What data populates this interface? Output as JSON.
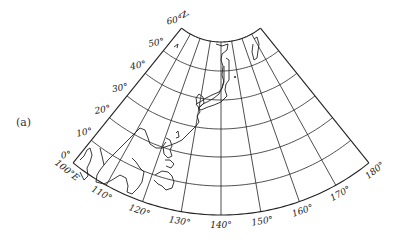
{
  "figure": {
    "panel_label": "(a)",
    "projection": "conic",
    "north_label": "N",
    "east_label_suffix": "E",
    "line_color": "#222222",
    "background": "#ffffff"
  },
  "graticule": {
    "apex": [
      221,
      -21
    ],
    "lon_center": 140,
    "deg_per_lon": 0.97,
    "lat_radius": {
      "0": 236,
      "10": 207,
      "20": 178,
      "30": 150,
      "40": 121,
      "50": 92,
      "60": 63
    },
    "latitudes": [
      0,
      10,
      20,
      30,
      40,
      50,
      60
    ],
    "longitudes": [
      100,
      110,
      120,
      130,
      140,
      150,
      160,
      170,
      180
    ],
    "lat_labels": [
      "0°",
      "10°",
      "20°",
      "30°",
      "40°",
      "50°",
      "60°"
    ],
    "lon_labels": [
      "100°E",
      "110°",
      "120°",
      "130°",
      "140°",
      "150°",
      "160°",
      "170°",
      "180°"
    ]
  },
  "coastlines": [
    {
      "name": "sakhalin-island",
      "points": [
        [
          254,
          39
        ],
        [
          257,
          37
        ],
        [
          259,
          44
        ],
        [
          257,
          58
        ],
        [
          254,
          60
        ],
        [
          252,
          52
        ],
        [
          253,
          44
        ]
      ]
    },
    {
      "name": "kamchatka-small-island",
      "points": [
        [
          174,
          47
        ],
        [
          178,
          44
        ],
        [
          177,
          48
        ]
      ]
    },
    {
      "name": "asia-coast-north",
      "points": [
        [
          216,
          44
        ],
        [
          222,
          46
        ],
        [
          228,
          44
        ],
        [
          227,
          50
        ],
        [
          222,
          54
        ],
        [
          221,
          60
        ],
        [
          223,
          66
        ],
        [
          222,
          75
        ],
        [
          224,
          82
        ],
        [
          222,
          88
        ],
        [
          219,
          92
        ],
        [
          212,
          95
        ],
        [
          206,
          98
        ],
        [
          200,
          102
        ],
        [
          196,
          104
        ],
        [
          199,
          108
        ],
        [
          200,
          112
        ],
        [
          197,
          116
        ],
        [
          199,
          122
        ],
        [
          196,
          126
        ],
        [
          192,
          130
        ],
        [
          186,
          136
        ],
        [
          182,
          140
        ],
        [
          176,
          143
        ],
        [
          168,
          146
        ],
        [
          162,
          148
        ],
        [
          156,
          148
        ],
        [
          150,
          144
        ],
        [
          148,
          138
        ],
        [
          145,
          130
        ],
        [
          140,
          128
        ],
        [
          136,
          132
        ],
        [
          130,
          138
        ],
        [
          125,
          143
        ],
        [
          120,
          148
        ],
        [
          116,
          152
        ],
        [
          112,
          156
        ],
        [
          108,
          160
        ],
        [
          104,
          165
        ]
      ]
    },
    {
      "name": "japan-honshu",
      "points": [
        [
          226,
          58
        ],
        [
          229,
          60
        ],
        [
          229,
          80
        ],
        [
          226,
          84
        ],
        [
          225,
          90
        ],
        [
          227,
          96
        ],
        [
          221,
          102
        ],
        [
          214,
          105
        ],
        [
          208,
          107
        ],
        [
          201,
          110
        ],
        [
          198,
          108
        ],
        [
          203,
          104
        ],
        [
          209,
          101
        ],
        [
          214,
          98
        ],
        [
          219,
          94
        ],
        [
          222,
          88
        ],
        [
          224,
          80
        ],
        [
          224,
          66
        ]
      ]
    },
    {
      "name": "korea-peninsula",
      "points": [
        [
          199,
          108
        ],
        [
          204,
          103
        ],
        [
          203,
          97
        ],
        [
          199,
          94
        ],
        [
          196,
          98
        ],
        [
          197,
          104
        ]
      ]
    },
    {
      "name": "taiwan",
      "points": [
        [
          176,
          133
        ],
        [
          178,
          131
        ],
        [
          179,
          137
        ],
        [
          176,
          138
        ]
      ]
    },
    {
      "name": "indochina-coast",
      "points": [
        [
          100,
          148
        ],
        [
          102,
          156
        ],
        [
          104,
          165
        ],
        [
          100,
          170
        ],
        [
          97,
          175
        ],
        [
          96,
          182
        ],
        [
          104,
          184
        ],
        [
          112,
          180
        ],
        [
          120,
          175
        ],
        [
          126,
          178
        ],
        [
          128,
          186
        ],
        [
          127,
          192
        ],
        [
          132,
          194
        ],
        [
          138,
          188
        ],
        [
          142,
          182
        ],
        [
          144,
          172
        ],
        [
          140,
          168
        ],
        [
          136,
          162
        ],
        [
          132,
          158
        ]
      ]
    },
    {
      "name": "malay-peninsula",
      "points": [
        [
          80,
          160
        ],
        [
          84,
          156
        ],
        [
          87,
          150
        ],
        [
          90,
          148
        ],
        [
          92,
          155
        ],
        [
          90,
          162
        ],
        [
          87,
          168
        ],
        [
          88,
          176
        ],
        [
          84,
          180
        ],
        [
          80,
          172
        ]
      ]
    },
    {
      "name": "borneo",
      "points": [
        [
          155,
          175
        ],
        [
          162,
          171
        ],
        [
          168,
          172
        ],
        [
          172,
          176
        ],
        [
          174,
          182
        ],
        [
          172,
          188
        ],
        [
          166,
          190
        ],
        [
          162,
          186
        ],
        [
          158,
          184
        ],
        [
          154,
          180
        ]
      ]
    },
    {
      "name": "philippines",
      "points": [
        [
          166,
          138
        ],
        [
          170,
          140
        ],
        [
          172,
          146
        ],
        [
          170,
          150
        ],
        [
          172,
          156
        ],
        [
          168,
          158
        ],
        [
          164,
          154
        ],
        [
          163,
          146
        ],
        [
          166,
          142
        ]
      ]
    },
    {
      "name": "philippines-south",
      "points": [
        [
          165,
          160
        ],
        [
          170,
          160
        ],
        [
          174,
          164
        ],
        [
          171,
          168
        ],
        [
          166,
          166
        ]
      ]
    }
  ],
  "points_of_interest": [
    {
      "name": "small-island-dot",
      "xy": [
        235,
        77
      ]
    }
  ]
}
